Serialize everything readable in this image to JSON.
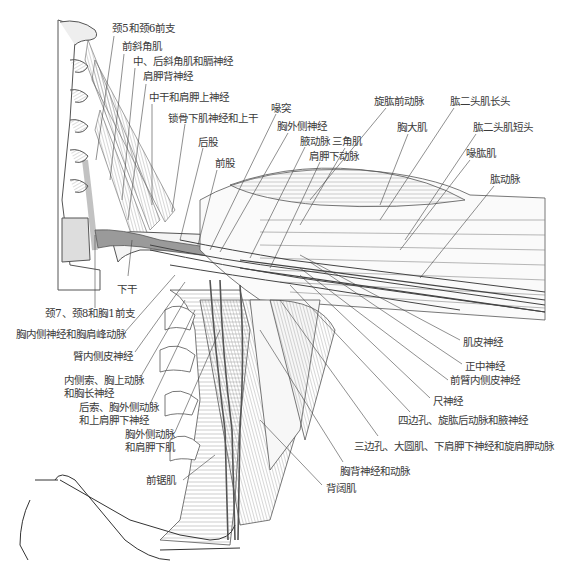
{
  "figure": {
    "caption": "",
    "colors": {
      "line": "#555555",
      "muscle_fill": "#f2f2f2",
      "vessel_fill": "#9a9a9a",
      "bone_fill": "#e6e6e6",
      "text": "#3a3a3a"
    },
    "labels": [
      {
        "id": "c5c6",
        "text": "颈5和颈6前支",
        "x": 112,
        "y": 28
      },
      {
        "id": "ant_scalene",
        "text": "前斜角肌",
        "x": 122,
        "y": 46
      },
      {
        "id": "mid_post_scalene",
        "text": "中、后斜角肌和膈神经",
        "x": 133,
        "y": 61
      },
      {
        "id": "dorsal_scapular",
        "text": "肩胛背神经",
        "x": 143,
        "y": 76
      },
      {
        "id": "middle_trunk",
        "text": "中干和肩胛上神经",
        "x": 149,
        "y": 96
      },
      {
        "id": "subclavian_upper",
        "text": "锁骨下肌神经和上干",
        "x": 168,
        "y": 117
      },
      {
        "id": "coracoid",
        "text": "喙突",
        "x": 271,
        "y": 107
      },
      {
        "id": "lat_pectoral_n",
        "text": "胸外侧神经",
        "x": 277,
        "y": 126
      },
      {
        "id": "axillary_a",
        "text": "腋动脉",
        "x": 300,
        "y": 140
      },
      {
        "id": "subscapular_a",
        "text": "肩胛下动脉",
        "x": 309,
        "y": 155
      },
      {
        "id": "post_cord",
        "text": "后股",
        "x": 198,
        "y": 141
      },
      {
        "id": "ant_cord",
        "text": "前股",
        "x": 215,
        "y": 162
      },
      {
        "id": "deltoid",
        "text": "三角肌",
        "x": 332,
        "y": 140
      },
      {
        "id": "ant_circ_humeral",
        "text": "旋肱前动脉",
        "x": 374,
        "y": 100
      },
      {
        "id": "pect_major",
        "text": "胸大肌",
        "x": 397,
        "y": 126
      },
      {
        "id": "biceps_long",
        "text": "肱二头肌长头",
        "x": 450,
        "y": 100
      },
      {
        "id": "biceps_short",
        "text": "肱二头肌短头",
        "x": 473,
        "y": 126
      },
      {
        "id": "coracobrachialis",
        "text": "喙肱肌",
        "x": 466,
        "y": 152
      },
      {
        "id": "brachial_a",
        "text": "肱动脉",
        "x": 490,
        "y": 178
      },
      {
        "id": "lower_trunk",
        "text": "下干",
        "x": 117,
        "y": 279
      },
      {
        "id": "c7c8t1",
        "text": "颈7、颈8和胸1前支",
        "x": 45,
        "y": 311
      },
      {
        "id": "med_pectoral",
        "text": "胸内侧神经和胸肩峰动脉",
        "x": 16,
        "y": 332
      },
      {
        "id": "med_brach_cut",
        "text": "臂内侧皮神经",
        "x": 73,
        "y": 354
      },
      {
        "id": "med_cord_1",
        "text": "内侧索、胸上动脉",
        "x": 64,
        "y": 378
      },
      {
        "id": "med_cord_2",
        "text": "和胸长神经",
        "x": 64,
        "y": 390
      },
      {
        "id": "post_cord_1",
        "text": "后索、胸外侧动脉",
        "x": 79,
        "y": 404
      },
      {
        "id": "post_cord_2",
        "text": "和上肩胛下神经",
        "x": 79,
        "y": 416
      },
      {
        "id": "lat_thoracic_1",
        "text": "胸外侧动脉",
        "x": 125,
        "y": 430
      },
      {
        "id": "lat_thoracic_2",
        "text": "和肩胛下肌",
        "x": 125,
        "y": 442
      },
      {
        "id": "serratus_ant",
        "text": "前锯肌",
        "x": 146,
        "y": 476
      },
      {
        "id": "musculocutaneous",
        "text": "肌皮神经",
        "x": 463,
        "y": 338
      },
      {
        "id": "median",
        "text": "正中神经",
        "x": 465,
        "y": 362
      },
      {
        "id": "med_antebrach",
        "text": "前臂内侧皮神经",
        "x": 450,
        "y": 376
      },
      {
        "id": "ulnar",
        "text": "尺神经",
        "x": 433,
        "y": 396
      },
      {
        "id": "quadrangular",
        "text": "四边孔、旋肱后动脉和腋神经",
        "x": 398,
        "y": 414
      },
      {
        "id": "triangular",
        "text": "三边孔、大圆肌、下肩胛下神经和旋肩胛动脉",
        "x": 354,
        "y": 438
      },
      {
        "id": "thoracodorsal",
        "text": "胸背神经和动脉",
        "x": 340,
        "y": 465
      },
      {
        "id": "lat_dorsi",
        "text": "背阔肌",
        "x": 326,
        "y": 482
      }
    ]
  }
}
